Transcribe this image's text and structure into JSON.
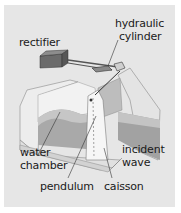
{
  "diagram": {
    "type": "oscillating-wave-surge-converter-cutaway",
    "background_color": "#e6e6e6",
    "labels": {
      "rectifier": "rectifier",
      "hydraulic_1": "hydraulic",
      "hydraulic_2": "cylinder",
      "water_1": "water",
      "water_2": "chamber",
      "incident_1": "incident",
      "incident_2": "wave",
      "pendulum": "pendulum",
      "caisson": "caisson"
    },
    "colors": {
      "structure_light": "#f4f4f4",
      "structure_mid": "#d6d6d6",
      "water_dark": "#a8a8a8",
      "water_light": "#c8c8c8",
      "rectifier": "#6e6e6e",
      "lines": "#333333"
    }
  }
}
